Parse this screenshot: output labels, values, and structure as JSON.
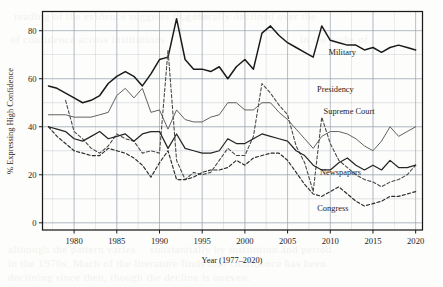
{
  "chart_data": {
    "type": "line",
    "title": "",
    "xlabel": "Year (1977–2020)",
    "ylabel": "% Expressing High Confidence",
    "xlim": [
      1976.3,
      2020.8
    ],
    "ylim": [
      -3,
      88
    ],
    "xticks": [
      1980,
      1985,
      1990,
      1995,
      2000,
      2005,
      2010,
      2015,
      2020
    ],
    "yticks": [
      0,
      20,
      40,
      60,
      80
    ],
    "ytick_labels": [
      "0",
      "20",
      "40",
      "60",
      "80"
    ],
    "xtick_labels": [
      "1980",
      "1985",
      "1990",
      "1995",
      "2000",
      "2005",
      "2010",
      "2015",
      "2020"
    ],
    "grid": true,
    "grid_minor_y_step": 10,
    "grid_color": "#b9c0cc",
    "legend": "inline-labels",
    "series": [
      {
        "name": "Military",
        "style": "solid",
        "width": 1.5,
        "color": "#1a1a1a",
        "label_x": 2011.4,
        "label_y": 70.0,
        "x": [
          1977,
          1978,
          1979,
          1980,
          1981,
          1982,
          1983,
          1984,
          1985,
          1986,
          1987,
          1988,
          1989,
          1990,
          1991,
          1992,
          1993,
          1994,
          1995,
          1996,
          1997,
          1998,
          1999,
          2000,
          2001,
          2002,
          2003,
          2004,
          2005,
          2006,
          2007,
          2008,
          2009,
          2010,
          2011,
          2012,
          2013,
          2014,
          2015,
          2016,
          2017,
          2018,
          2019,
          2020
        ],
        "y": [
          57,
          56,
          54,
          52,
          50,
          51,
          53,
          58,
          61,
          63,
          61,
          57,
          62,
          68,
          69,
          85,
          68,
          64,
          64,
          63,
          65,
          60,
          65,
          68,
          64,
          79,
          82,
          78,
          75,
          73,
          71,
          69,
          82,
          76,
          75,
          74,
          74,
          72,
          73,
          71,
          73,
          74,
          73,
          72
        ]
      },
      {
        "name": "Presidency",
        "style": "dashed",
        "width": 1.1,
        "color": "#4a4a4a",
        "label_x": 2010.6,
        "label_y": 54.5,
        "x": [
          1979,
          1980,
          1981,
          1982,
          1983,
          1984,
          1985,
          1986,
          1987,
          1988,
          1989,
          1990,
          1991,
          1992,
          1993,
          1994,
          1995,
          1996,
          1997,
          1998,
          1999,
          2000,
          2001,
          2002,
          2003,
          2004,
          2005,
          2006,
          2007,
          2008,
          2009,
          2010,
          2011,
          2012,
          2013,
          2014,
          2015,
          2016,
          2017,
          2018,
          2019,
          2020
        ],
        "y": [
          51,
          38,
          35,
          31,
          29,
          32,
          37,
          35,
          34,
          29,
          30,
          29,
          72,
          26,
          18,
          21,
          20,
          21,
          26,
          31,
          28,
          28,
          36,
          58,
          54,
          49,
          45,
          32,
          25,
          13,
          44,
          33,
          26,
          23,
          20,
          18,
          17,
          15,
          17,
          18,
          20,
          24
        ]
      },
      {
        "name": "Supreme Court",
        "style": "solid",
        "width": 0.95,
        "color": "#585858",
        "label_x": 2012.2,
        "label_y": 45.5,
        "x": [
          1977,
          1978,
          1979,
          1980,
          1981,
          1982,
          1983,
          1984,
          1985,
          1986,
          1987,
          1988,
          1989,
          1990,
          1991,
          1992,
          1993,
          1994,
          1995,
          1996,
          1997,
          1998,
          1999,
          2000,
          2001,
          2002,
          2003,
          2004,
          2005,
          2006,
          2007,
          2008,
          2009,
          2010,
          2011,
          2012,
          2013,
          2014,
          2015,
          2016,
          2017,
          2018,
          2019,
          2020
        ],
        "y": [
          45,
          45,
          45,
          44,
          44,
          44,
          45,
          46,
          53,
          56,
          52,
          56,
          46,
          47,
          39,
          47,
          43,
          42,
          42,
          44,
          45,
          50,
          50,
          47,
          47,
          50,
          50,
          46,
          43,
          39,
          35,
          31,
          36,
          38,
          38,
          37,
          35,
          32,
          30,
          34,
          40,
          36,
          38,
          40
        ]
      },
      {
        "name": "Newspapers",
        "style": "solid",
        "width": 1.25,
        "color": "#252525",
        "label_x": 2011.2,
        "label_y": 19.8,
        "x": [
          1977,
          1978,
          1979,
          1980,
          1981,
          1982,
          1983,
          1984,
          1985,
          1986,
          1987,
          1988,
          1989,
          1990,
          1991,
          1992,
          1993,
          1994,
          1995,
          1996,
          1997,
          1998,
          1999,
          2000,
          2001,
          2002,
          2003,
          2004,
          2005,
          2006,
          2007,
          2008,
          2009,
          2010,
          2011,
          2012,
          2013,
          2014,
          2015,
          2016,
          2017,
          2018,
          2019,
          2020
        ],
        "y": [
          40,
          39,
          38,
          35,
          34,
          36,
          38,
          35,
          36,
          37,
          34,
          37,
          38,
          38,
          31,
          37,
          31,
          30,
          29,
          29,
          30,
          35,
          33,
          33,
          35,
          37,
          36,
          35,
          34,
          30,
          28,
          24,
          22,
          22,
          25,
          27,
          24,
          22,
          24,
          22,
          26,
          23,
          23,
          24
        ]
      },
      {
        "name": "Congress",
        "style": "dashed",
        "width": 1.15,
        "color": "#2b2b2b",
        "label_x": 2010.3,
        "label_y": 5.0,
        "x": [
          1977,
          1978,
          1979,
          1980,
          1981,
          1982,
          1983,
          1984,
          1985,
          1986,
          1987,
          1988,
          1989,
          1990,
          1991,
          1992,
          1993,
          1994,
          1995,
          1996,
          1997,
          1998,
          1999,
          2000,
          2001,
          2002,
          2003,
          2004,
          2005,
          2006,
          2007,
          2008,
          2009,
          2010,
          2011,
          2012,
          2013,
          2014,
          2015,
          2016,
          2017,
          2018,
          2019,
          2020
        ],
        "y": [
          40,
          36,
          33,
          30,
          29,
          28,
          28,
          31,
          30,
          29,
          27,
          24,
          19,
          25,
          30,
          18,
          18,
          19,
          21,
          22,
          22,
          23,
          26,
          24,
          27,
          28,
          29,
          29,
          26,
          21,
          16,
          12,
          11,
          13,
          15,
          12,
          9,
          7,
          8,
          9,
          11,
          11,
          12,
          13
        ]
      }
    ],
    "annotations": [
      {
        "text": "Military",
        "x": 2011.4,
        "y": 70.0
      },
      {
        "text": "Presidency",
        "x": 2010.6,
        "y": 54.5
      },
      {
        "text": "Supreme Court",
        "x": 2012.2,
        "y": 45.5
      },
      {
        "text": "Newspapers",
        "x": 2011.2,
        "y": 19.8
      },
      {
        "text": "Congress",
        "x": 2010.3,
        "y": 5.0
      }
    ]
  },
  "page_bleed": [
    {
      "text": "reading of the evidence suggests that the",
      "x": 14,
      "y": 5
    },
    {
      "text": "of confidence across institutions",
      "x": 10,
      "y": 28
    },
    {
      "text": "generally declined over the",
      "x": 186,
      "y": 5
    },
    {
      "text": "in the wake of",
      "x": 300,
      "y": 28
    },
    {
      "text": "although the pattern varies",
      "x": 8,
      "y": 238
    },
    {
      "text": "substantially by institution and period",
      "x": 150,
      "y": 238
    },
    {
      "text": "in the 1970s. Much of the literature finds that confidence has been",
      "x": 8,
      "y": 252
    },
    {
      "text": "declining since then, though the decline is uneven.",
      "x": 8,
      "y": 266
    }
  ]
}
